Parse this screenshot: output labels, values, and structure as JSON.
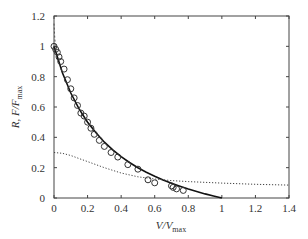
{
  "chart_data": {
    "type": "line",
    "title": "",
    "xlabel": "V/V",
    "xlabel_sub": "max",
    "ylabel": "R, F/F",
    "ylabel_sub": "max",
    "xlim": [
      0,
      1.4
    ],
    "ylim": [
      0,
      1.2
    ],
    "xticks": [
      0,
      0.2,
      0.4,
      0.6,
      0.8,
      1,
      1.2,
      1.4
    ],
    "xtick_labels": [
      "0",
      "0.2",
      "0.4",
      "0.6",
      "0.8",
      "1",
      "1.2",
      "1.4"
    ],
    "yticks": [
      0,
      0.2,
      0.4,
      0.6,
      0.8,
      1,
      1.2
    ],
    "ytick_labels": [
      "0",
      "0.2",
      "0.4",
      "0.6",
      "0.8",
      "1",
      "1.2"
    ],
    "grid": false,
    "legend": null,
    "series": [
      {
        "name": "force-velocity fit (solid)",
        "style": "solid",
        "x": [
          0,
          0.05,
          0.1,
          0.15,
          0.2,
          0.25,
          0.3,
          0.35,
          0.4,
          0.45,
          0.5,
          0.55,
          0.6,
          0.65,
          0.7,
          0.75,
          0.8,
          0.85,
          0.9,
          0.95,
          1.0
        ],
        "y": [
          1.0,
          0.826,
          0.692,
          0.586,
          0.5,
          0.43,
          0.368,
          0.317,
          0.273,
          0.234,
          0.2,
          0.17,
          0.143,
          0.119,
          0.097,
          0.077,
          0.059,
          0.043,
          0.027,
          0.013,
          0.0
        ]
      },
      {
        "name": "data (circles)",
        "style": "markers",
        "x": [
          0.0,
          0.01,
          0.02,
          0.03,
          0.04,
          0.06,
          0.08,
          0.1,
          0.12,
          0.14,
          0.16,
          0.18,
          0.2,
          0.22,
          0.24,
          0.27,
          0.3,
          0.34,
          0.38,
          0.44,
          0.5,
          0.56,
          0.6,
          0.7,
          0.71,
          0.73,
          0.77
        ],
        "y": [
          1.0,
          0.98,
          0.96,
          0.93,
          0.9,
          0.85,
          0.78,
          0.72,
          0.66,
          0.61,
          0.56,
          0.54,
          0.5,
          0.46,
          0.42,
          0.38,
          0.34,
          0.3,
          0.27,
          0.22,
          0.19,
          0.12,
          0.1,
          0.08,
          0.07,
          0.06,
          0.05
        ]
      },
      {
        "name": "R (dotted)",
        "style": "dotted",
        "x": [
          0,
          0.05,
          0.1,
          0.15,
          0.2,
          0.3,
          0.4,
          0.5,
          0.6,
          0.7,
          0.8,
          1.0,
          1.2,
          1.4
        ],
        "y": [
          0.3,
          0.295,
          0.28,
          0.26,
          0.24,
          0.2,
          0.165,
          0.14,
          0.125,
          0.115,
          0.108,
          0.098,
          0.09,
          0.085
        ]
      },
      {
        "name": "initial spike (dashed)",
        "style": "dashed",
        "x": [
          0.0,
          0.005,
          0.01
        ],
        "y": [
          1.15,
          1.05,
          0.98
        ]
      }
    ]
  }
}
